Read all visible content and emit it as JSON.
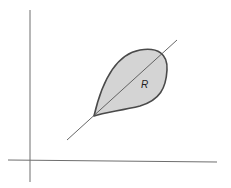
{
  "diagram": {
    "type": "region-in-plane",
    "colors": {
      "background": "#ffffff",
      "axis": "#6e6e6e",
      "line": "#555555",
      "region_fill": "#d4d4d4",
      "region_outline": "#4a4a4a",
      "label": "#222222"
    },
    "axes": {
      "x_axis": {
        "x1": 8,
        "y1": 160,
        "x2": 217,
        "y2": 162
      },
      "y_axis": {
        "x1": 30,
        "y1": 10,
        "x2": 30,
        "y2": 182
      }
    },
    "diagonal_line": {
      "x1": 67,
      "y1": 140,
      "x2": 177,
      "y2": 40
    },
    "region": {
      "label": "R",
      "label_x": 141,
      "label_y": 88,
      "tip": {
        "x": 94,
        "y": 116
      }
    }
  }
}
